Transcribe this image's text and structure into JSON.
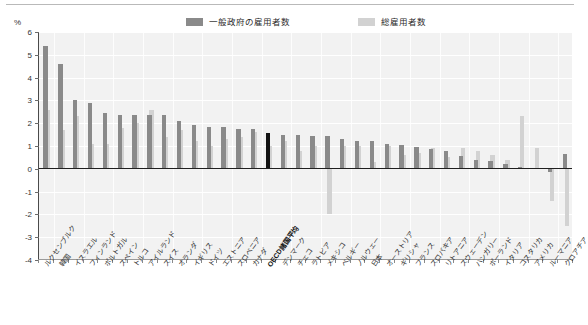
{
  "legend": {
    "items": [
      {
        "label": "一般政府の雇用者数",
        "color": "#8a8a8a",
        "name": "legend-government"
      },
      {
        "label": "総雇用者数",
        "color": "#d2d2d2",
        "name": "legend-total"
      }
    ]
  },
  "axis": {
    "unit": "%",
    "y_ticks": [
      6,
      5,
      4,
      3,
      2,
      1,
      0,
      -1,
      -2,
      -3,
      -4
    ]
  },
  "highlight": {
    "category": "OECD諸国平均",
    "color": "#141414"
  },
  "chart_data": {
    "type": "bar",
    "title": "",
    "xlabel": "",
    "ylabel": "%",
    "ylim": [
      -4,
      6
    ],
    "grid": true,
    "legend_position": "top",
    "highlight_category": "OECD諸国平均",
    "categories": [
      "ルクセンブルク",
      "韓国",
      "イスラエル",
      "フィンランド",
      "ポルトガル",
      "スペイン",
      "トルコ",
      "アイルランド",
      "スイス",
      "オランダ",
      "イギリス",
      "ドイツ",
      "エストニア",
      "スロベニア",
      "カナダ",
      "OECD諸国平均",
      "デンマーク",
      "チェコ",
      "ラトビア",
      "メキシコ",
      "ベルギー",
      "ノルウェー",
      "日本",
      "オーストリア",
      "ギリシャ",
      "フランス",
      "スロバキア",
      "リトアニア",
      "スウェーデン",
      "ハンガリー",
      "ポーランド",
      "イタリア",
      "コスタリカ",
      "アメリカ",
      "ルーマニア",
      "クロアチア"
    ],
    "series": [
      {
        "name": "一般政府の雇用者数",
        "color": "#8a8a8a",
        "values": [
          5.4,
          4.6,
          3.0,
          2.9,
          2.45,
          2.35,
          2.35,
          2.35,
          2.35,
          2.1,
          1.9,
          1.85,
          1.85,
          1.75,
          1.75,
          1.55,
          1.5,
          1.5,
          1.45,
          1.45,
          1.3,
          1.2,
          1.2,
          1.1,
          1.05,
          0.95,
          0.85,
          0.8,
          0.55,
          0.4,
          0.35,
          0.2,
          0.1,
          0.05,
          -0.15,
          0.65
        ]
      },
      {
        "name": "総雇用者数",
        "color": "#d2d2d2",
        "values": [
          2.6,
          1.7,
          2.3,
          1.1,
          1.1,
          1.8,
          2.0,
          2.6,
          1.4,
          1.7,
          1.2,
          1.0,
          1.3,
          1.4,
          1.6,
          1.0,
          1.2,
          0.8,
          1.0,
          -2.0,
          1.0,
          1.0,
          0.3,
          1.0,
          0.6,
          0.7,
          0.9,
          0.5,
          0.9,
          0.8,
          0.6,
          0.4,
          2.3,
          0.9,
          -1.4,
          -2.5
        ]
      }
    ]
  }
}
